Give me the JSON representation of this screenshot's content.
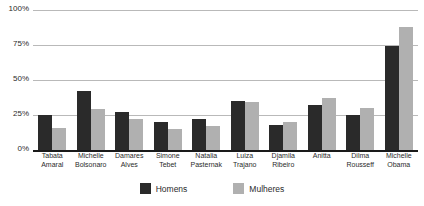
{
  "chart_data": {
    "type": "bar",
    "title": "",
    "subtitle": "",
    "xlabel": "",
    "ylabel": "",
    "ylim": [
      0,
      100
    ],
    "yticks": [
      "0%",
      "25%",
      "50%",
      "75%",
      "100%"
    ],
    "grid": true,
    "legend_position": "bottom",
    "categories": [
      "Tabata\nAmaral",
      "Michelle\nBolsonaro",
      "Damares\nAlves",
      "Simone\nTebet",
      "Natalia\nPasternak",
      "Luiza\nTrajano",
      "Djamila\nRibeiro",
      "Anitta",
      "Dilma\nRousseff",
      "Michelle\nObama"
    ],
    "series": [
      {
        "name": "Homens",
        "color": "#2a2a2a",
        "values": [
          25,
          42,
          27,
          20,
          22,
          35,
          18,
          32,
          25,
          74
        ]
      },
      {
        "name": "Mulheres",
        "color": "#b0b0b0",
        "values": [
          16,
          29,
          22,
          15,
          17,
          34,
          20,
          37,
          30,
          88
        ]
      }
    ]
  },
  "axis": {
    "y_ticks": [
      {
        "label": "100%",
        "value": 100
      },
      {
        "label": "75%",
        "value": 75
      },
      {
        "label": "50%",
        "value": 50
      },
      {
        "label": "25%",
        "value": 25
      },
      {
        "label": "0%",
        "value": 0
      }
    ]
  },
  "legend": {
    "items": [
      {
        "label": "Homens",
        "color": "#2a2a2a"
      },
      {
        "label": "Mulheres",
        "color": "#b0b0b0"
      }
    ]
  },
  "colors": {
    "homens": "#2a2a2a",
    "mulheres": "#b0b0b0",
    "gridline": "#b9b9b9",
    "axis": "#1a1a1a",
    "background": "#ffffff",
    "text": "#2b2b2b"
  }
}
